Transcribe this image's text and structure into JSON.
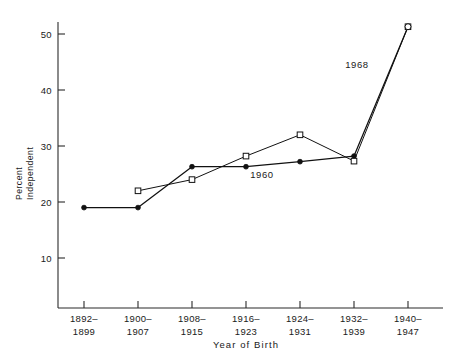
{
  "chart_data": {
    "type": "line",
    "title": "",
    "xlabel": "Year of Birth",
    "ylabel_line1": "Percent",
    "ylabel_line2": "Independent",
    "categories": [
      "1892–1899",
      "1900–1907",
      "1908–1915",
      "1916–1923",
      "1924–1931",
      "1932–1939",
      "1940–1947"
    ],
    "category_lines": [
      [
        "1892–",
        "1899"
      ],
      [
        "1900–",
        "1907"
      ],
      [
        "1908–",
        "1915"
      ],
      [
        "1916–",
        "1923"
      ],
      [
        "1924–",
        "1931"
      ],
      [
        "1932–",
        "1939"
      ],
      [
        "1940–",
        "1947"
      ]
    ],
    "ylim": [
      0,
      53
    ],
    "yticks": [
      10,
      20,
      30,
      40,
      50
    ],
    "ytick_labels": [
      "10",
      "20",
      "30",
      "40",
      "50"
    ],
    "grid": false,
    "legend_position": "inline-annotations",
    "series": [
      {
        "name": "1960",
        "marker": "filled-circle",
        "annotation": "1960",
        "x": [
          "1892–1899",
          "1900–1907",
          "1908–1915",
          "1916–1923",
          "1924–1931",
          "1932–1939",
          "1940–1947"
        ],
        "values": [
          19.0,
          19.0,
          26.3,
          26.3,
          27.2,
          28.2,
          51.3
        ]
      },
      {
        "name": "1968",
        "marker": "open-square",
        "annotation": "1968",
        "x": [
          "1900–1907",
          "1908–1915",
          "1916–1923",
          "1924–1931",
          "1932–1939",
          "1940–1947"
        ],
        "values": [
          22.0,
          24.0,
          28.2,
          32.0,
          27.3,
          51.3
        ]
      }
    ],
    "annotations": [
      {
        "text": "1960",
        "x_pixel": 262,
        "y_pixel": 178
      },
      {
        "text": "1968",
        "x_pixel": 357,
        "y_pixel": 68
      }
    ]
  }
}
